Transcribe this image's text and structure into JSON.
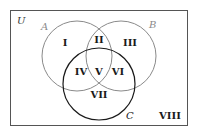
{
  "diagram": {
    "type": "venn",
    "universe_label": "U",
    "sets": [
      {
        "name": "A",
        "color": "#8a8a8a"
      },
      {
        "name": "B",
        "color": "#8a8a8a"
      },
      {
        "name": "C",
        "color": "#1a1a1a"
      }
    ],
    "regions": [
      "I",
      "II",
      "III",
      "IV",
      "V",
      "VI",
      "VII",
      "VIII"
    ],
    "colors": {
      "frame": "#555555",
      "text": "#1a1a1a",
      "light_label": "#8a8a8a"
    }
  }
}
